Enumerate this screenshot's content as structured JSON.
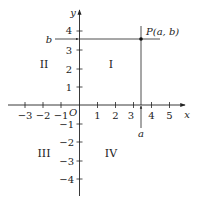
{
  "diagram": {
    "type": "cartesian-plane",
    "axes": {
      "x_label": "x",
      "y_label": "y",
      "origin_label": "O",
      "x_ticks": [
        "−3",
        "−2",
        "−1",
        "1",
        "2",
        "3",
        "4",
        "5"
      ],
      "y_ticks_positive": [
        "1",
        "2",
        "3",
        "4"
      ],
      "y_ticks_negative": [
        "−1",
        "−2",
        "−3",
        "−4"
      ]
    },
    "quadrants": {
      "q1": "I",
      "q2": "II",
      "q3": "III",
      "q4": "IV"
    },
    "point": {
      "label": "P(a, b)",
      "x_coord_label": "a",
      "y_coord_label": "b",
      "approx_x": 3.4,
      "approx_y": 3.6
    },
    "colors": {
      "line": "#222222",
      "background": "#ffffff"
    }
  }
}
